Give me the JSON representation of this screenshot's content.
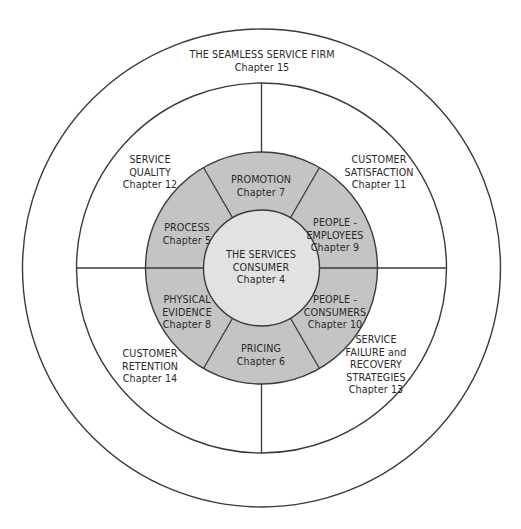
{
  "diagram": {
    "colors": {
      "ring_fill": "#c4c4c4",
      "center_fill": "#e2e2e2",
      "stroke": "#3a3a3a",
      "background": "#ffffff"
    },
    "geometry": {
      "center": [
        261.5,
        268
      ],
      "outer_radius": 239,
      "middle_radius": 185,
      "ring_radius": 116,
      "inner_radius": 58
    },
    "outer_ring": {
      "title": "THE SEAMLESS SERVICE FIRM",
      "chapter": "Chapter 15"
    },
    "middle_ring": [
      {
        "id": "service-quality",
        "lines": [
          "SERVICE",
          "QUALITY"
        ],
        "chapter": "Chapter 12"
      },
      {
        "id": "customer-satisfaction",
        "lines": [
          "CUSTOMER",
          "SATISFACTION"
        ],
        "chapter": "Chapter 11"
      },
      {
        "id": "customer-retention",
        "lines": [
          "CUSTOMER",
          "RETENTION"
        ],
        "chapter": "Chapter 14"
      },
      {
        "id": "service-failure",
        "lines": [
          "SERVICE",
          "FAILURE and",
          "RECOVERY",
          "STRATEGIES"
        ],
        "chapter": "Chapter 13"
      }
    ],
    "gray_ring": [
      {
        "id": "promotion",
        "lines": [
          "PROMOTION"
        ],
        "chapter": "Chapter 7"
      },
      {
        "id": "people-employees",
        "lines": [
          "PEOPLE -",
          "EMPLOYEES"
        ],
        "chapter": "Chapter 9"
      },
      {
        "id": "people-consumers",
        "lines": [
          "PEOPLE -",
          "CONSUMERS"
        ],
        "chapter": "Chapter 10"
      },
      {
        "id": "pricing",
        "lines": [
          "PRICING"
        ],
        "chapter": "Chapter 6"
      },
      {
        "id": "physical-evidence",
        "lines": [
          "PHYSICAL",
          "EVIDENCE"
        ],
        "chapter": "Chapter 8"
      },
      {
        "id": "process",
        "lines": [
          "PROCESS"
        ],
        "chapter": "Chapter 5"
      }
    ],
    "center": {
      "lines": [
        "THE SERVICES",
        "CONSUMER"
      ],
      "chapter": "Chapter 4"
    }
  }
}
